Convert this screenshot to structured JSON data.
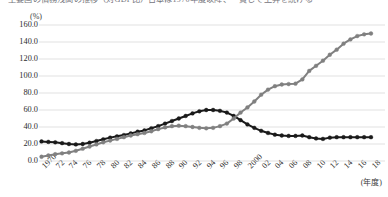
{
  "title_clipped": "主要国の債務残高の推移（対GDP比）日本は1970年度以降、一貫して上昇を続ける",
  "axes": {
    "y_unit": "(%)",
    "x_unit": "(年度)",
    "y_ticks": [
      "0.0",
      "20.0",
      "40.0",
      "60.0",
      "80.0",
      "100.0",
      "120.0",
      "140.0",
      "160.0"
    ],
    "y_min": 0,
    "y_max": 160,
    "y_step": 20,
    "x_ticks": [
      "1970",
      "72",
      "74",
      "76",
      "78",
      "80",
      "82",
      "84",
      "86",
      "88",
      "90",
      "92",
      "94",
      "96",
      "98",
      "2000",
      "02",
      "04",
      "06",
      "08",
      "10",
      "12",
      "14",
      "16",
      "18"
    ]
  },
  "colors": {
    "series_dark": "#1a1a1a",
    "series_gray": "#808080",
    "gridline": "#d9d9d9",
    "text": "#2b2b2b"
  },
  "chart_data": {
    "type": "line",
    "title": "",
    "xlabel": "(年度)",
    "ylabel": "(%)",
    "ylim": [
      0,
      160
    ],
    "xlim": [
      1970,
      2018
    ],
    "grid": true,
    "legend": "none",
    "markers": true,
    "x": [
      1970,
      1971,
      1972,
      1973,
      1974,
      1975,
      1976,
      1977,
      1978,
      1979,
      1980,
      1981,
      1982,
      1983,
      1984,
      1985,
      1986,
      1987,
      1988,
      1989,
      1990,
      1991,
      1992,
      1993,
      1994,
      1995,
      1996,
      1997,
      1998,
      1999,
      2000,
      2001,
      2002,
      2003,
      2004,
      2005,
      2006,
      2007,
      2008,
      2009,
      2010,
      2011,
      2012,
      2013,
      2014,
      2015,
      2016,
      2017,
      2018
    ],
    "series": [
      {
        "name": "series-dark",
        "color": "#1a1a1a",
        "values": [
          23.0,
          22.5,
          22.0,
          21.0,
          20.0,
          19.5,
          20.0,
          21.5,
          23.5,
          25.5,
          27.5,
          29.0,
          30.5,
          32.5,
          34.5,
          36.0,
          38.5,
          41.0,
          44.0,
          47.0,
          50.0,
          53.0,
          56.0,
          58.5,
          60.0,
          60.0,
          59.0,
          57.0,
          53.0,
          48.0,
          43.0,
          39.0,
          35.5,
          33.0,
          31.0,
          30.0,
          29.5,
          29.5,
          30.0,
          28.0,
          26.5,
          26.0,
          27.5,
          28.0,
          28.0,
          28.0,
          28.0,
          28.0,
          28.0
        ]
      },
      {
        "name": "series-gray",
        "color": "#808080",
        "values": [
          5.0,
          6.5,
          8.0,
          9.0,
          10.0,
          12.0,
          14.5,
          17.0,
          19.5,
          22.0,
          24.0,
          26.0,
          28.0,
          30.0,
          31.5,
          33.0,
          35.0,
          37.5,
          39.5,
          41.0,
          41.5,
          41.0,
          40.0,
          39.0,
          38.5,
          39.0,
          41.0,
          44.0,
          50.0,
          57.0,
          63.0,
          70.0,
          78.0,
          84.0,
          88.0,
          90.0,
          90.5,
          91.0,
          96.0,
          106.0,
          112.0,
          118.0,
          125.0,
          131.0,
          138.0,
          143.0,
          147.0,
          149.0,
          150.0
        ]
      }
    ]
  }
}
